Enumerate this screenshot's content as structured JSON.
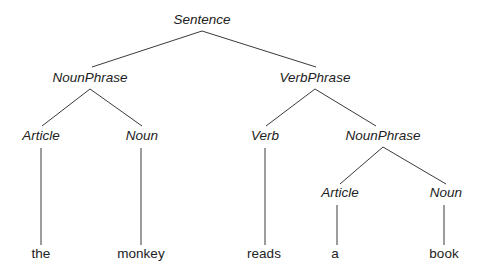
{
  "figure": {
    "sentence": "the monkey reads a book",
    "background_color": "#ffffff",
    "line_color": "#3a3a3a",
    "text_color": "#222222"
  },
  "nodes": {
    "sentence": {
      "label": "Sentence",
      "x": 202,
      "y": 24,
      "style": "italic"
    },
    "np_subject": {
      "label": "NounPhrase",
      "x": 90,
      "y": 82,
      "style": "italic"
    },
    "vp": {
      "label": "VerbPhrase",
      "x": 315,
      "y": 82,
      "style": "italic"
    },
    "article_left": {
      "label": "Article",
      "x": 41,
      "y": 140,
      "style": "italic"
    },
    "noun_left": {
      "label": "Noun",
      "x": 142,
      "y": 140,
      "style": "italic"
    },
    "verb": {
      "label": "Verb",
      "x": 265,
      "y": 140,
      "style": "italic"
    },
    "np_object": {
      "label": "NounPhrase",
      "x": 383,
      "y": 140,
      "style": "italic"
    },
    "article_right": {
      "label": "Article",
      "x": 340,
      "y": 197,
      "style": "italic"
    },
    "noun_right": {
      "label": "Noun",
      "x": 446,
      "y": 197,
      "style": "italic"
    }
  },
  "terminals": {
    "the": {
      "label": "the",
      "x": 41,
      "y": 258,
      "style": "normal"
    },
    "monkey": {
      "label": "monkey",
      "x": 141,
      "y": 258,
      "style": "normal"
    },
    "reads": {
      "label": "reads",
      "x": 264,
      "y": 258,
      "style": "normal"
    },
    "a": {
      "label": "a",
      "x": 335,
      "y": 258,
      "style": "normal"
    },
    "book": {
      "label": "book",
      "x": 444,
      "y": 258,
      "style": "normal"
    }
  },
  "edges": [
    {
      "name": "sentence-to-nounphrase",
      "x1": 202,
      "y1": 31,
      "x2": 92,
      "y2": 67
    },
    {
      "name": "sentence-to-verbphrase",
      "x1": 202,
      "y1": 31,
      "x2": 316,
      "y2": 67
    },
    {
      "name": "nounphrase-to-article",
      "x1": 90,
      "y1": 89,
      "x2": 42,
      "y2": 126
    },
    {
      "name": "nounphrase-to-noun",
      "x1": 90,
      "y1": 89,
      "x2": 142,
      "y2": 126
    },
    {
      "name": "verbphrase-to-verb",
      "x1": 315,
      "y1": 89,
      "x2": 266,
      "y2": 126
    },
    {
      "name": "verbphrase-to-nounphrase",
      "x1": 315,
      "y1": 89,
      "x2": 376,
      "y2": 126
    },
    {
      "name": "nounphrase2-to-article",
      "x1": 383,
      "y1": 147,
      "x2": 340,
      "y2": 184
    },
    {
      "name": "nounphrase2-to-noun",
      "x1": 383,
      "y1": 147,
      "x2": 446,
      "y2": 184
    },
    {
      "name": "article-to-the",
      "x1": 41,
      "y1": 148,
      "x2": 41,
      "y2": 245
    },
    {
      "name": "noun-to-monkey",
      "x1": 141,
      "y1": 148,
      "x2": 141,
      "y2": 245
    },
    {
      "name": "verb-to-reads",
      "x1": 265,
      "y1": 148,
      "x2": 265,
      "y2": 245
    },
    {
      "name": "article2-to-a",
      "x1": 337,
      "y1": 205,
      "x2": 337,
      "y2": 245
    },
    {
      "name": "noun2-to-book",
      "x1": 444,
      "y1": 205,
      "x2": 444,
      "y2": 245
    }
  ]
}
